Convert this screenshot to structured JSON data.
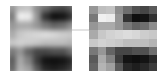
{
  "diagram": {
    "grid_size": 8,
    "left_image": {
      "label": "original-blurred-patch",
      "values": [
        [
          150,
          190,
          195,
          140,
          110,
          80,
          70,
          90
        ],
        [
          120,
          240,
          235,
          150,
          50,
          15,
          20,
          50
        ],
        [
          150,
          170,
          170,
          150,
          120,
          100,
          110,
          140
        ],
        [
          170,
          200,
          210,
          215,
          220,
          215,
          205,
          200
        ],
        [
          200,
          210,
          205,
          200,
          190,
          190,
          190,
          180
        ],
        [
          120,
          150,
          100,
          70,
          70,
          80,
          80,
          110
        ],
        [
          90,
          170,
          130,
          60,
          20,
          15,
          20,
          40
        ],
        [
          100,
          180,
          160,
          90,
          40,
          30,
          40,
          60
        ]
      ]
    },
    "right_image": {
      "label": "pixelated-patch",
      "values": [
        [
          150,
          190,
          195,
          140,
          110,
          80,
          70,
          90
        ],
        [
          120,
          240,
          235,
          150,
          50,
          15,
          20,
          50
        ],
        [
          150,
          170,
          170,
          150,
          120,
          100,
          110,
          140
        ],
        [
          170,
          200,
          210,
          215,
          220,
          215,
          205,
          200
        ],
        [
          200,
          210,
          205,
          200,
          190,
          190,
          190,
          180
        ],
        [
          120,
          150,
          100,
          70,
          70,
          80,
          80,
          110
        ],
        [
          90,
          170,
          130,
          60,
          20,
          15,
          20,
          40
        ],
        [
          100,
          180,
          160,
          90,
          40,
          30,
          40,
          60
        ]
      ]
    },
    "arrow": {
      "direction": "right",
      "color": "#c8c8c8"
    }
  }
}
